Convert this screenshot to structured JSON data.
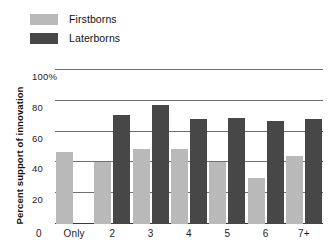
{
  "chart_data": {
    "type": "bar",
    "title": "",
    "xlabel": "",
    "ylabel": "Percent support of innovation",
    "ylim": [
      0,
      100
    ],
    "yticks": [
      0,
      20,
      40,
      60,
      80,
      100
    ],
    "ytick_labels": [
      "0",
      "20",
      "40",
      "60",
      "80",
      "100%"
    ],
    "grid": true,
    "legend_position": "top-left",
    "categories": [
      "Only",
      "2",
      "3",
      "4",
      "5",
      "6",
      "7+"
    ],
    "series": [
      {
        "name": "Firstborns",
        "color": "#b9b9b9",
        "values": [
          47,
          40,
          49,
          49,
          40,
          30,
          44
        ]
      },
      {
        "name": "Laterborns",
        "color": "#474747",
        "values": [
          null,
          71,
          77,
          68,
          69,
          67,
          68
        ]
      }
    ]
  },
  "legend": {
    "entries": [
      {
        "label": "Firstborns",
        "swatch": "#b9b9b9"
      },
      {
        "label": "Laterborns",
        "swatch": "#474747"
      }
    ]
  },
  "axes": {
    "y_title": "Percent support of innovation",
    "y_labels": [
      "100%",
      "80",
      "60",
      "40",
      "20"
    ],
    "x_origin": "0",
    "x_labels": [
      "Only",
      "2",
      "3",
      "4",
      "5",
      "6",
      "7+"
    ]
  }
}
